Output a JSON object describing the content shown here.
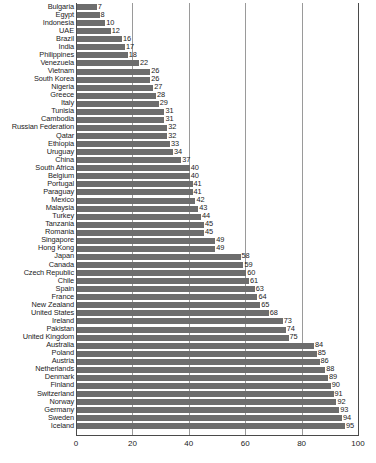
{
  "chart_data": {
    "type": "bar",
    "orientation": "horizontal",
    "title": "",
    "subtitle": "",
    "xlabel": "",
    "ylabel": "",
    "xlim": [
      0,
      100
    ],
    "xticks": [
      0,
      20,
      40,
      60,
      80,
      100
    ],
    "grid": true,
    "legend": null,
    "value_labels": true,
    "categories": [
      "Bulgaria",
      "Egypt",
      "Indonesia",
      "UAE",
      "Brazil",
      "India",
      "Philippines",
      "Venezuela",
      "Vietnam",
      "South Korea",
      "Nigeria",
      "Greece",
      "Italy",
      "Tunisia",
      "Cambodia",
      "Russian Federation",
      "Qatar",
      "Ethiopia",
      "Uruguay",
      "China",
      "South Africa",
      "Belgium",
      "Portugal",
      "Paraguay",
      "Mexico",
      "Malaysia",
      "Turkey",
      "Tanzania",
      "Romania",
      "Singapore",
      "Hong Kong",
      "Japan",
      "Canada",
      "Czech Republic",
      "Chile",
      "Spain",
      "France",
      "New Zealand",
      "United States",
      "Ireland",
      "Pakistan",
      "United Kingdom",
      "Australia",
      "Poland",
      "Austria",
      "Netherlands",
      "Denmark",
      "Finland",
      "Switzerland",
      "Norway",
      "Germany",
      "Sweden",
      "Iceland"
    ],
    "values": [
      7,
      8,
      10,
      12,
      16,
      17,
      18,
      22,
      26,
      26,
      27,
      28,
      29,
      31,
      31,
      32,
      32,
      33,
      34,
      37,
      40,
      40,
      41,
      41,
      42,
      43,
      44,
      45,
      45,
      49,
      49,
      58,
      59,
      60,
      61,
      63,
      64,
      65,
      68,
      73,
      74,
      75,
      84,
      85,
      86,
      88,
      89,
      90,
      91,
      92,
      93,
      94,
      95
    ],
    "colors": {
      "bar": "#6d6d6d",
      "grid": "#9a9a9a",
      "axis": "#4a4a4a",
      "text": "#1b1b1b",
      "background": "#ffffff"
    }
  }
}
